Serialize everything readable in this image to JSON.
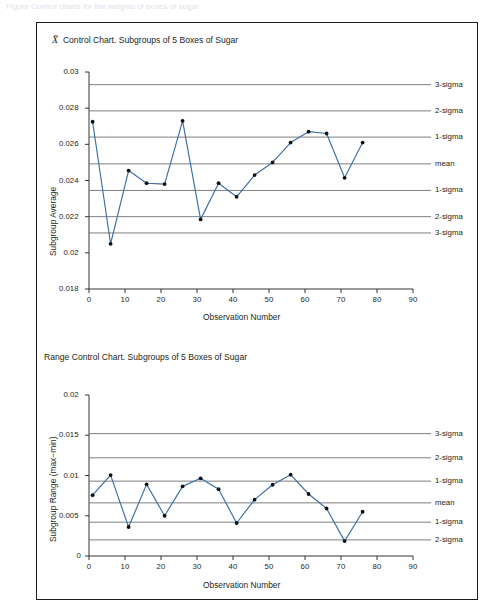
{
  "page": {
    "cut_caption": "Figure     Control charts for the weights of boxes of sugar",
    "line_color": "#3a6ea5",
    "limit_color": "#6f7073",
    "axis_color": "#231f20",
    "marker_color": "#111111"
  },
  "charts": [
    {
      "id": "xbar-control-chart",
      "title_prefix": "X",
      "title": "Control Chart. Subgroups of 5 Boxes of Sugar",
      "ylabel": "Subgroup Average",
      "xlabel": "Observation Number",
      "yticks": [
        "0.018",
        "0.02",
        "0.022",
        "0.024",
        "0.026",
        "0.028",
        "0.03"
      ],
      "xticks": [
        "0",
        "10",
        "20",
        "30",
        "40",
        "50",
        "60",
        "70",
        "80",
        "90"
      ],
      "limits": [
        {
          "label": "3-sigma",
          "value": 0.0293
        },
        {
          "label": "2-sigma",
          "value": 0.02785
        },
        {
          "label": "1-sigma",
          "value": 0.0264
        },
        {
          "label": "mean",
          "value": 0.02492
        },
        {
          "label": "1-sigma",
          "value": 0.02345
        },
        {
          "label": "2-sigma",
          "value": 0.022
        },
        {
          "label": "3-sigma",
          "value": 0.0211
        }
      ],
      "chart_data": {
        "type": "line",
        "title": "X̄ Control Chart. Subgroups of 5 Boxes of Sugar",
        "xlabel": "Observation Number",
        "ylabel": "Subgroup Average",
        "xlim": [
          0,
          90
        ],
        "ylim": [
          0.018,
          0.03
        ],
        "grid": false,
        "legend": "right-labels",
        "x": [
          1,
          6,
          11,
          16,
          21,
          26,
          31,
          36,
          41,
          46,
          51,
          56,
          61,
          66,
          71,
          76
        ],
        "values": [
          0.02725,
          0.0205,
          0.02455,
          0.02385,
          0.0238,
          0.0273,
          0.02185,
          0.02385,
          0.0231,
          0.0243,
          0.025,
          0.0261,
          0.0267,
          0.0266,
          0.02415,
          0.0261
        ]
      }
    },
    {
      "id": "range-control-chart",
      "title_prefix": "",
      "title": "Range Control Chart. Subgroups of 5 Boxes of Sugar",
      "ylabel": "Subgroup Range (max−min)",
      "xlabel": "Observation Number",
      "yticks": [
        "0",
        "0.005",
        "0.01",
        "0.015",
        "0.02"
      ],
      "xticks": [
        "0",
        "10",
        "20",
        "30",
        "40",
        "50",
        "60",
        "70",
        "80",
        "90"
      ],
      "limits": [
        {
          "label": "3-sigma",
          "value": 0.0152
        },
        {
          "label": "2-sigma",
          "value": 0.0122
        },
        {
          "label": "1-sigma",
          "value": 0.0093
        },
        {
          "label": "mean",
          "value": 0.0066
        },
        {
          "label": "1-sigma",
          "value": 0.0042
        },
        {
          "label": "2-sigma",
          "value": 0.002
        }
      ],
      "chart_data": {
        "type": "line",
        "title": "Range Control Chart. Subgroups of 5 Boxes of Sugar",
        "xlabel": "Observation Number",
        "ylabel": "Subgroup Range (max−min)",
        "xlim": [
          0,
          90
        ],
        "ylim": [
          0,
          0.02
        ],
        "grid": false,
        "legend": "right-labels",
        "x": [
          1,
          6,
          11,
          16,
          21,
          26,
          31,
          36,
          41,
          46,
          51,
          56,
          61,
          66,
          71,
          76
        ],
        "values": [
          0.00755,
          0.01005,
          0.0036,
          0.0089,
          0.005,
          0.00865,
          0.00965,
          0.0083,
          0.0041,
          0.007,
          0.00885,
          0.0101,
          0.0077,
          0.0059,
          0.00185,
          0.0055
        ]
      }
    }
  ]
}
